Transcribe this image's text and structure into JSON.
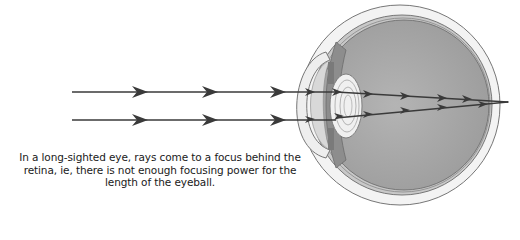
{
  "diagram": {
    "caption_lines": [
      "In a long-sighted eye, rays come to a focus behind the",
      "retina, ie, there is not enough focusing power for the",
      "length of the eyeball."
    ],
    "elements": {
      "incoming_rays": 2,
      "focus_point": "behind retina",
      "parts": [
        "cornea",
        "lens",
        "iris",
        "vitreous humour",
        "retina",
        "sclera"
      ]
    },
    "colors": {
      "ray": "#3a3a3a",
      "sclera": "#f2f2f2",
      "vitreous": "#a9a9a9",
      "outline": "#6e6e6e"
    }
  }
}
